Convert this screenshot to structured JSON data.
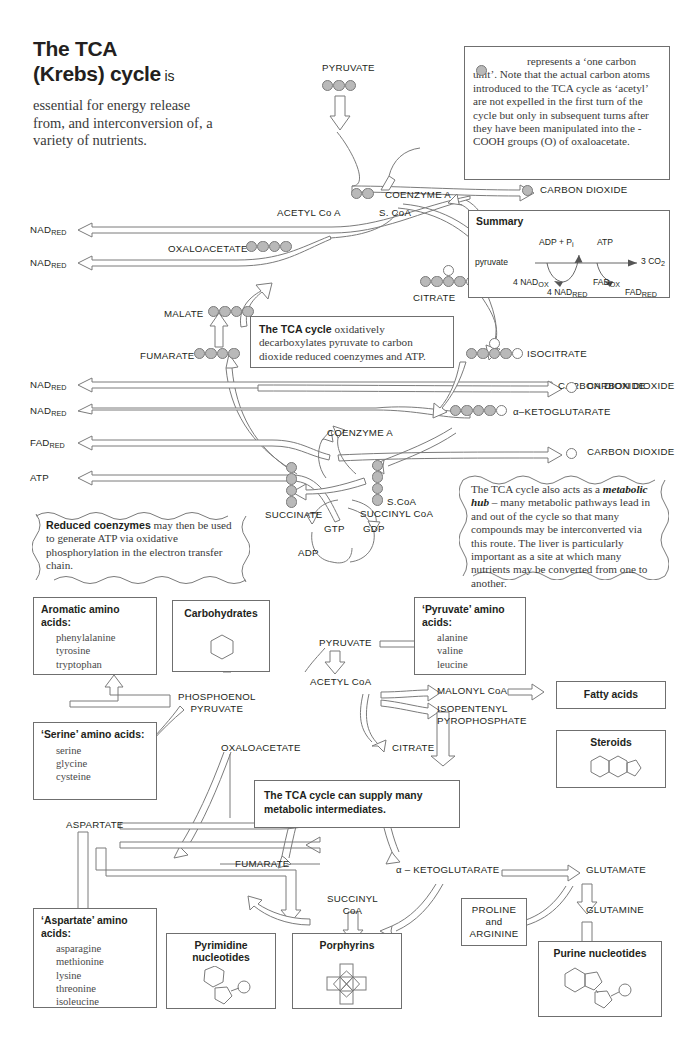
{
  "title": {
    "line1": "The TCA",
    "line2": "(Krebs) cycle",
    "lite": " is"
  },
  "intro": "essential for energy release from, and interconversion of, a variety of nutrients.",
  "legend_note": "represents a ‘one carbon unit’. Note that the actual carbon atoms introduced to the TCA cycle as ‘acetyl’ are not expelled in the first turn of the cycle but only in subsequent turns after they have been manipulated into the -COOH groups (O) of oxaloacetate.",
  "notes": {
    "decarb_bold": "The TCA cycle",
    "decarb_rest": " oxidatively decarboxylates pyruvate to carbon dioxide reduced coenzymes and ATP.",
    "hub_pre": "The TCA cycle also acts as a ",
    "hub_em": "metabolic hub",
    "hub_rest": " – many metabolic pathways lead in and out of the cycle so that many compounds may be interconverted via this route. The liver is particularly important as a site at which many nutrients may be converted from one to another.",
    "reduced_bold": "Reduced coenzymes",
    "reduced_rest": " may then be used to generate ATP via oxidative phosphorylation in the electron transfer chain.",
    "supply": "The TCA cycle can supply many metabolic intermediates."
  },
  "summary": {
    "heading": "Summary",
    "substrate": "pyruvate",
    "product": "3 CO",
    "product_sub": "2",
    "adp": "ADP + P",
    "adp_sub": "i",
    "atp": "ATP",
    "nadox_n": "4 NAD",
    "nadox_sub": "OX",
    "nadred_n": "4 NAD",
    "nadred_sub": "RED",
    "fadox": "FAD",
    "fadox_sub": "OX",
    "fadred": "FAD",
    "fadred_sub": "RED"
  },
  "cycle": {
    "pyruvate": "PYRUVATE",
    "coenzyme_a_top": "COENZYME A",
    "acetyl_coa": "ACETYL Co A",
    "s_coa_top": "S. CoA",
    "oxaloacetate": "OXALOACETATE",
    "malate": "MALATE",
    "fumarate": "FUMARATE",
    "citrate": "CITRATE",
    "isocitrate": "ISOCITRATE",
    "ketoglutarate": "α–KETOGLUTARATE",
    "succinate": "SUCCINATE",
    "succinyl_coa": "SUCCINYL CoA",
    "s_coa": "S.CoA",
    "coenzyme_a_mid": "COENZYME A",
    "gtp": "GTP",
    "gdp": "GDP",
    "adp": "ADP",
    "co2": "CARBON DIOXIDE",
    "nad_red": "NAD",
    "fad_red": "FAD",
    "sub_red": "RED",
    "atp": "ATP"
  },
  "cofactor_rows": [
    {
      "name": "NAD",
      "sub": "RED"
    },
    {
      "name": "NAD",
      "sub": "RED"
    },
    {
      "name": "NAD",
      "sub": "RED"
    },
    {
      "name": "NAD",
      "sub": "RED"
    },
    {
      "name": "FAD",
      "sub": "RED"
    },
    {
      "name": "ATP",
      "sub": ""
    }
  ],
  "carbons": {
    "pyruvate": [
      "g",
      "g",
      "g"
    ],
    "acetyl": [
      "g",
      "g"
    ],
    "oxaloacetate": [
      "g",
      "g",
      "g",
      "g"
    ],
    "malate": [
      "g",
      "g",
      "g",
      "g"
    ],
    "fumarate": [
      "g",
      "g",
      "g",
      "g"
    ],
    "citrate_row": [
      "g",
      "g",
      "g",
      "g",
      "w"
    ],
    "citrate_top": "w",
    "isocitrate_row": [
      "g",
      "g",
      "g",
      "g",
      "w"
    ],
    "isocitrate_top": "w",
    "ketoglutarate": [
      "g",
      "g",
      "g",
      "g",
      "w"
    ],
    "succinate": [
      "g",
      "g",
      "g",
      "g"
    ],
    "succinyl": [
      "g",
      "g",
      "g",
      "g"
    ],
    "co2_top": "g",
    "co2_mid": "w",
    "co2_low": "w"
  },
  "lower": {
    "boxes": {
      "aromatic": {
        "head": "Aromatic amino acids:",
        "list": "phenylalanine\ntyrosine\ntryptophan"
      },
      "carbohydrates": {
        "head": "Carbohydrates"
      },
      "pyruvate_aa": {
        "head": "‘Pyruvate’ amino acids:",
        "list": "alanine\nvaline\nleucine"
      },
      "serine_aa": {
        "head": "‘Serine’ amino acids:",
        "list": "serine\nglycine\ncysteine"
      },
      "aspartate_aa": {
        "head": "‘Aspartate’ amino acids:",
        "list": "asparagine\nmethionine\nlysine\nthreonine\nisoleucine"
      },
      "fatty_acids": {
        "head": "Fatty acids"
      },
      "steroids": {
        "head": "Steroids"
      },
      "pyrimidine": {
        "head": "Pyrimidine\nnucleotides"
      },
      "porphyrins": {
        "head": "Porphyrins"
      },
      "purine": {
        "head": "Purine nucleotides"
      },
      "proline_arginine": {
        "head": "PROLINE\nand\nARGININE"
      }
    },
    "labels": {
      "pyruvate": "PYRUVATE",
      "acetyl_coa": "ACETYL CoA",
      "pep": "PHOSPHOENOL\nPYRUVATE",
      "oxaloacetate": "OXALOACETATE",
      "citrate": "CITRATE",
      "malonyl": "MALONYL CoA",
      "isopentenyl": "ISOPENTENYL\nPYROPHOSPHATE",
      "aspartate": "ASPARTATE",
      "fumarate": "FUMARATE",
      "succinyl_coa": "SUCCINYL\nCoA",
      "ketoglutarate": "α – KETOGLUTARATE",
      "glutamate": "GLUTAMATE",
      "glutamine": "GLUTAMINE"
    }
  },
  "colors": {
    "carbon_gray": "#b9b9b9",
    "stroke": "#6f6f6f",
    "text": "#231f20"
  }
}
